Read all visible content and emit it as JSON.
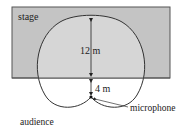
{
  "diagram": {
    "labels": {
      "stage": "stage",
      "audience": "audience",
      "microphone": "microphone",
      "distance_upper": "12 m",
      "distance_lower": "4 m"
    },
    "colors": {
      "stage_fill": "#c4c4c4",
      "cardioid_inside_stage": "#d6d6d6",
      "outline": "#333333",
      "background": "#ffffff"
    },
    "measurements": {
      "front_reach_m": 12,
      "back_reach_m": 4
    }
  }
}
